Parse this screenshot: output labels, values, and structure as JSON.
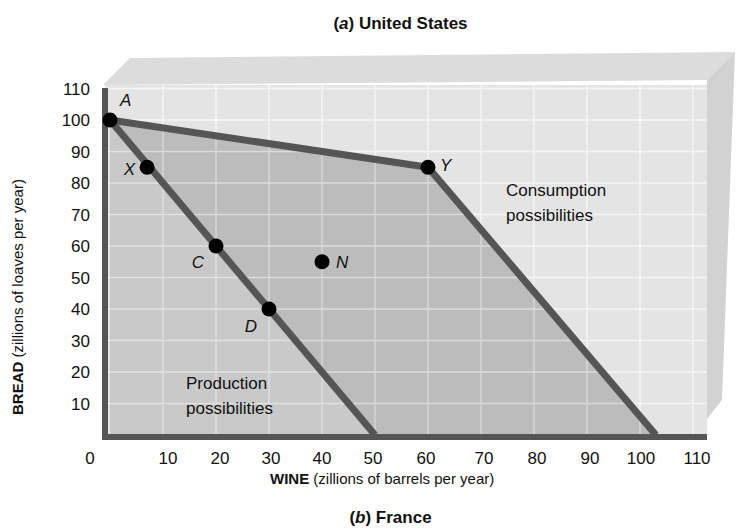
{
  "chart_data": {
    "type": "line",
    "title": "(a) United States",
    "title_prefix": "(a)",
    "title_text": "United States",
    "footer_title_prefix": "(b)",
    "footer_title_text": "France",
    "xlabel_bold": "WINE",
    "xlabel_rest": "(zillions of barrels per year)",
    "ylabel_bold": "BREAD",
    "ylabel_rest": "(zillions of loaves per year)",
    "xlim": [
      0,
      110
    ],
    "ylim": [
      0,
      110
    ],
    "x_ticks": [
      0,
      10,
      20,
      30,
      40,
      50,
      60,
      70,
      80,
      90,
      100,
      110
    ],
    "y_ticks": [
      10,
      20,
      30,
      40,
      50,
      60,
      70,
      80,
      90,
      100,
      110
    ],
    "grid": true,
    "series": [
      {
        "name": "Production possibilities",
        "x": [
          0,
          50
        ],
        "y": [
          100,
          0
        ]
      },
      {
        "name": "Consumption possibilities",
        "x": [
          0,
          60,
          103
        ],
        "y": [
          100,
          85,
          0
        ]
      }
    ],
    "points": [
      {
        "label": "A",
        "x": 0,
        "y": 100
      },
      {
        "label": "X",
        "x": 7,
        "y": 85
      },
      {
        "label": "C",
        "x": 20,
        "y": 60
      },
      {
        "label": "D",
        "x": 30,
        "y": 40
      },
      {
        "label": "N",
        "x": 40,
        "y": 55
      },
      {
        "label": "Y",
        "x": 60,
        "y": 85
      }
    ],
    "annotations": [
      {
        "text_line1": "Production",
        "text_line2": "possibilities"
      },
      {
        "text_line1": "Consumption",
        "text_line2": "possibilities"
      }
    ]
  },
  "colors": {
    "back_panel": "#d9d9d9",
    "production_fill": "#d4d4d4",
    "consumption_fill": "#bdbdbd",
    "line": "#555555",
    "axis": "#555555",
    "grid": "#f4f4f4",
    "point": "#000000"
  }
}
